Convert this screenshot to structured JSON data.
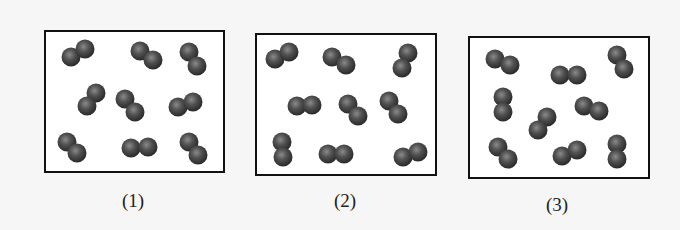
{
  "figure": {
    "colors": {
      "background": "#f6f6f6",
      "box_fill": "#ffffff",
      "box_border": "#111111",
      "atom_dark": "#2e2e2e",
      "atom_light": "#8a8a8a"
    },
    "atom_radius": 9.5,
    "panels": [
      {
        "label": "(1)",
        "box": {
          "x": 45,
          "y": 31,
          "w": 179,
          "h": 141
        },
        "label_pos": {
          "x": 133,
          "y": 207
        },
        "molecules": [
          [
            [
              71,
              57
            ],
            [
              85,
              49
            ]
          ],
          [
            [
              140,
              51
            ],
            [
              153,
              60
            ]
          ],
          [
            [
              189,
              52
            ],
            [
              197,
              66
            ]
          ],
          [
            [
              96,
              93
            ],
            [
              87,
              106
            ]
          ],
          [
            [
              125,
              99
            ],
            [
              135,
              112
            ]
          ],
          [
            [
              178,
              107
            ],
            [
              193,
              102
            ]
          ],
          [
            [
              67,
              142
            ],
            [
              77,
              153
            ]
          ],
          [
            [
              131,
              148
            ],
            [
              148,
              147
            ]
          ],
          [
            [
              189,
              142
            ],
            [
              198,
              155
            ]
          ]
        ]
      },
      {
        "label": "(2)",
        "box": {
          "x": 256,
          "y": 34,
          "w": 180,
          "h": 141
        },
        "label_pos": {
          "x": 345,
          "y": 207
        },
        "molecules": [
          [
            [
              275,
              59
            ],
            [
              289,
              52
            ]
          ],
          [
            [
              332,
              57
            ],
            [
              346,
              65
            ]
          ],
          [
            [
              408,
              53
            ],
            [
              402,
              68
            ]
          ],
          [
            [
              297,
              106
            ],
            [
              312,
              105
            ]
          ],
          [
            [
              348,
              104
            ],
            [
              358,
              116
            ]
          ],
          [
            [
              389,
              101
            ],
            [
              398,
              114
            ]
          ],
          [
            [
              282,
              142
            ],
            [
              283,
              157
            ]
          ],
          [
            [
              328,
              154
            ],
            [
              344,
              154
            ]
          ],
          [
            [
              403,
              157
            ],
            [
              418,
              152
            ]
          ]
        ]
      },
      {
        "label": "(3)",
        "box": {
          "x": 469,
          "y": 37,
          "w": 180,
          "h": 141
        },
        "label_pos": {
          "x": 557,
          "y": 211
        },
        "molecules": [
          [
            [
              495,
              59
            ],
            [
              510,
              65
            ]
          ],
          [
            [
              560,
              75
            ],
            [
              577,
              75
            ]
          ],
          [
            [
              617,
              55
            ],
            [
              624,
              69
            ]
          ],
          [
            [
              503,
              97
            ],
            [
              503,
              112
            ]
          ],
          [
            [
              547,
              117
            ],
            [
              538,
              130
            ]
          ],
          [
            [
              584,
              106
            ],
            [
              599,
              111
            ]
          ],
          [
            [
              498,
              147
            ],
            [
              508,
              159
            ]
          ],
          [
            [
              562,
              156
            ],
            [
              577,
              150
            ]
          ],
          [
            [
              617,
              144
            ],
            [
              617,
              159
            ]
          ]
        ]
      }
    ]
  }
}
